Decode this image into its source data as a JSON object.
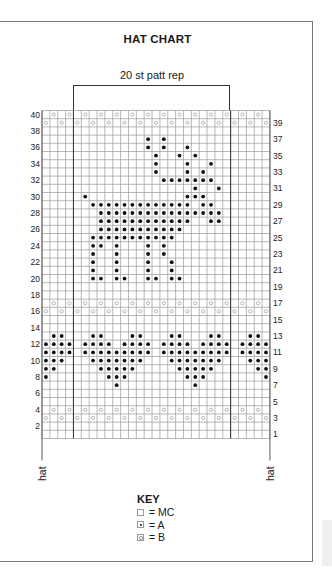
{
  "chart": {
    "title": "HAT CHART",
    "repeat_label": "20 st patt rep",
    "repeat_start_col": 5,
    "repeat_end_col": 24,
    "columns": 29,
    "rows": 40,
    "edge_label_left": "hat",
    "edge_label_right": "hat",
    "left_row_labels": [
      "40",
      "38",
      "36",
      "34",
      "32",
      "30",
      "28",
      "26",
      "24",
      "22",
      "20",
      "18",
      "16",
      "14",
      "12",
      "10",
      "8",
      "6",
      "4",
      "2"
    ],
    "right_row_labels": [
      "39",
      "37",
      "35",
      "33",
      "31",
      "29",
      "27",
      "25",
      "23",
      "21",
      "19",
      "17",
      "15",
      "13",
      "11",
      "9",
      "7",
      "5",
      "3",
      "1"
    ]
  },
  "key": {
    "title": "KEY",
    "items": [
      {
        "symbol": "empty-square",
        "label": "= MC"
      },
      {
        "symbol": "dot",
        "label": "= A"
      },
      {
        "symbol": "circle",
        "label": "= B"
      }
    ]
  },
  "colors": {
    "grid_line": "#9a9a9a",
    "repeat_line": "#333333",
    "dot_A": "#111111",
    "circle_B": "#8a8a8a",
    "frame": "#7a7a7a"
  },
  "chart_data": {
    "type": "table",
    "title": "HAT CHART",
    "subtitle": "20 st patt rep",
    "legend": {
      "MC": "empty",
      "A": "dot",
      "B": "circle"
    },
    "grid_size": {
      "cols": 29,
      "rows": 40
    },
    "cells_A": {
      "37": [
        14,
        16
      ],
      "36": [
        14,
        16,
        19
      ],
      "35": [
        15,
        18,
        20
      ],
      "34": [
        15,
        19,
        22
      ],
      "33": [
        15,
        19,
        21
      ],
      "32": [
        16,
        17,
        18,
        19,
        20,
        21,
        22
      ],
      "31": [
        20,
        23
      ],
      "30": [
        6,
        19,
        20,
        21
      ],
      "29": [
        7,
        8,
        9,
        10,
        11,
        12,
        13,
        14,
        15,
        16,
        17,
        18,
        19,
        21,
        22
      ],
      "28": [
        8,
        9,
        10,
        11,
        12,
        13,
        14,
        15,
        16,
        17,
        18,
        19,
        20,
        21,
        22,
        23
      ],
      "27": [
        8,
        9,
        10,
        11,
        12,
        13,
        14,
        15,
        16,
        17,
        18,
        19,
        22,
        23
      ],
      "26": [
        8,
        9,
        10,
        11,
        12,
        13,
        14,
        15,
        16,
        17,
        18
      ],
      "25": [
        7,
        8,
        9,
        10,
        11,
        12,
        13,
        14,
        15,
        16,
        17
      ],
      "24": [
        7,
        8,
        10,
        14,
        16
      ],
      "23": [
        7,
        10,
        14,
        16
      ],
      "22": [
        7,
        10,
        14,
        17
      ],
      "21": [
        7,
        10,
        14,
        17
      ],
      "20": [
        7,
        8,
        10,
        11,
        14,
        15,
        17,
        18
      ],
      "13": [
        2,
        3,
        7,
        8,
        12,
        13,
        17,
        18,
        22,
        23,
        27,
        28
      ],
      "12": [
        1,
        2,
        3,
        4,
        6,
        7,
        8,
        9,
        11,
        12,
        13,
        14,
        16,
        17,
        18,
        19,
        21,
        22,
        23,
        24,
        26,
        27,
        28,
        29
      ],
      "11": [
        1,
        2,
        3,
        4,
        6,
        7,
        8,
        9,
        10,
        11,
        12,
        13,
        14,
        16,
        17,
        18,
        19,
        20,
        21,
        22,
        23,
        24,
        26,
        27,
        28,
        29
      ],
      "10": [
        1,
        2,
        3,
        7,
        8,
        9,
        10,
        11,
        12,
        13,
        17,
        18,
        19,
        20,
        21,
        22,
        23,
        27,
        28,
        29
      ],
      "9": [
        1,
        2,
        8,
        9,
        10,
        11,
        12,
        18,
        19,
        20,
        21,
        22,
        28,
        29
      ],
      "8": [
        1,
        9,
        10,
        11,
        19,
        20,
        21,
        29
      ],
      "7": [
        10,
        20
      ]
    },
    "cells_B": {
      "40": "even columns",
      "39": "odd columns",
      "17": "even columns",
      "16": "odd columns",
      "4": "even columns",
      "3": "odd columns"
    }
  }
}
